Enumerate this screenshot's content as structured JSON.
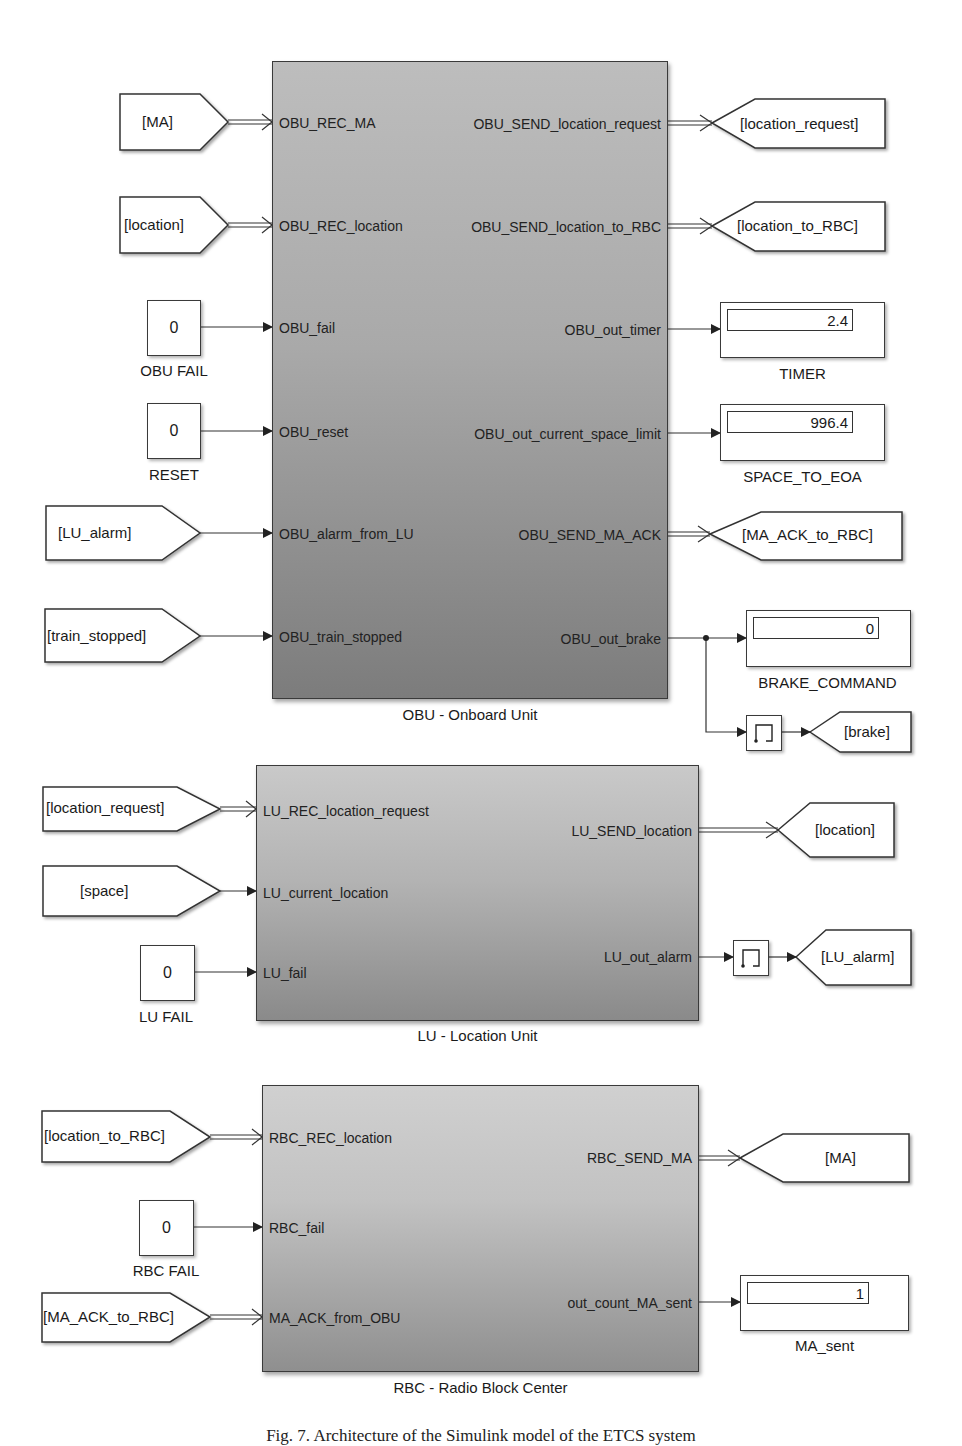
{
  "diagram": {
    "type": "Simulink block diagram",
    "subsystems": {
      "obu": {
        "caption": "OBU - Onboard Unit",
        "inputs": [
          "OBU_REC_MA",
          "OBU_REC_location",
          "OBU_fail",
          "OBU_reset",
          "OBU_alarm_from_LU",
          "OBU_train_stopped"
        ],
        "outputs": [
          "OBU_SEND_location_request",
          "OBU_SEND_location_to_RBC",
          "OBU_out_timer",
          "OBU_out_current_space_limit",
          "OBU_SEND_MA_ACK",
          "OBU_out_brake"
        ]
      },
      "lu": {
        "caption": "LU - Location Unit",
        "inputs": [
          "LU_REC_location_request",
          "LU_current_location",
          "LU_fail"
        ],
        "outputs": [
          "LU_SEND_location",
          "LU_out_alarm"
        ]
      },
      "rbc": {
        "caption": "RBC - Radio Block Center",
        "inputs": [
          "RBC_REC_location",
          "RBC_fail",
          "MA_ACK_from_OBU"
        ],
        "outputs": [
          "RBC_SEND_MA",
          "out_count_MA_sent"
        ]
      }
    },
    "from_tags": {
      "obu_ma": "[MA]",
      "obu_location": "[location]",
      "obu_lu_alarm": "[LU_alarm]",
      "obu_train_stopped": "[train_stopped]",
      "lu_location_request": "[location_request]",
      "lu_space": "[space]",
      "rbc_location_to_rbc": "[location_to_RBC]",
      "rbc_ma_ack": "[MA_ACK_to_RBC]"
    },
    "goto_tags": {
      "obu_location_request": "[location_request]",
      "obu_location_to_rbc": "[location_to_RBC]",
      "obu_ma_ack": "[MA_ACK_to_RBC]",
      "obu_brake": "[brake]",
      "lu_location": "[location]",
      "lu_alarm": "[LU_alarm]",
      "rbc_ma": "[MA]"
    },
    "constants": {
      "obu_fail": {
        "value": "0",
        "label": "OBU FAIL"
      },
      "reset": {
        "value": "0",
        "label": "RESET"
      },
      "lu_fail": {
        "value": "0",
        "label": "LU FAIL"
      },
      "rbc_fail": {
        "value": "0",
        "label": "RBC FAIL"
      }
    },
    "displays": {
      "timer": {
        "value": "2.4",
        "label": "TIMER"
      },
      "space_to_eoa": {
        "value": "996.4",
        "label": "SPACE_TO_EOA"
      },
      "brake_command": {
        "value": "0",
        "label": "BRAKE_COMMAND"
      },
      "ma_sent": {
        "value": "1",
        "label": "MA_sent"
      }
    },
    "figure_caption": "Fig. 7. Architecture of the Simulink model of the ETCS system"
  }
}
